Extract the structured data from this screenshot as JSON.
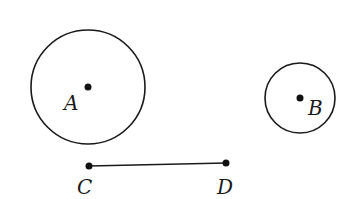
{
  "diagram": {
    "colors": {
      "stroke": "#1a1a1a",
      "point": "#111111",
      "background": "#ffffff"
    },
    "circles": [
      {
        "name": "circle-a",
        "center_label": "A",
        "cx": 88,
        "cy": 87,
        "r": 57
      },
      {
        "name": "circle-b",
        "center_label": "B",
        "cx": 300,
        "cy": 98,
        "r": 35
      }
    ],
    "points": {
      "A": {
        "label": "A",
        "x": 88,
        "y": 87,
        "label_x": 64,
        "label_y": 110
      },
      "B": {
        "label": "B",
        "x": 300,
        "y": 98,
        "label_x": 308,
        "label_y": 115
      },
      "C": {
        "label": "C",
        "x": 89,
        "y": 166,
        "label_x": 77,
        "label_y": 194
      },
      "D": {
        "label": "D",
        "x": 226,
        "y": 163,
        "label_x": 217,
        "label_y": 194
      }
    },
    "segments": [
      {
        "name": "segment-cd",
        "from": "C",
        "to": "D"
      }
    ]
  }
}
